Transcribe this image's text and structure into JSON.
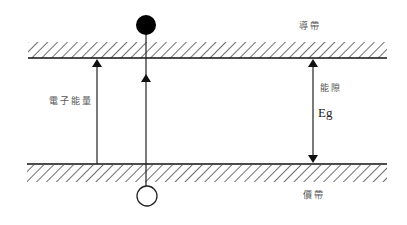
{
  "diagram": {
    "labels": {
      "conduction_band": "導帶",
      "valence_band": "價帶",
      "electron_energy": "電子能量",
      "band_gap": "能隙",
      "band_gap_symbol": "Eg"
    },
    "elements": {
      "electron": "filled circle (electron) above conduction band",
      "hole": "hollow circle (hole) below valence band"
    },
    "colors": {
      "line": "#111111",
      "label": "#555555",
      "background": "#ffffff"
    }
  }
}
